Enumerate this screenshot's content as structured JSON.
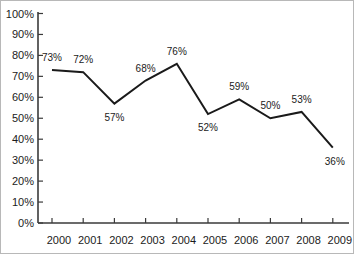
{
  "chart_data": {
    "type": "line",
    "title": "",
    "subtitle": "",
    "xlabel": "",
    "ylabel": "",
    "categories": [
      "2000",
      "2001",
      "2002",
      "2003",
      "2004",
      "2005",
      "2006",
      "2007",
      "2008",
      "2009"
    ],
    "values": [
      73,
      72,
      57,
      68,
      76,
      52,
      59,
      50,
      53,
      36
    ],
    "point_labels": [
      "73%",
      "72%",
      "57%",
      "68%",
      "76%",
      "52%",
      "59%",
      "50%",
      "53%",
      "36%"
    ],
    "ylim": [
      0,
      100
    ],
    "ytick_values": [
      0,
      10,
      20,
      30,
      40,
      50,
      60,
      70,
      80,
      90,
      100
    ],
    "ytick_labels": [
      "0%",
      "10%",
      "20%",
      "30%",
      "40%",
      "50%",
      "60%",
      "70%",
      "80%",
      "90%",
      "100%"
    ],
    "grid": false,
    "legend": "none",
    "series_color": "#1a1a1a",
    "axis_color": "#3a3a3a",
    "text_color": "#1b1b1b",
    "background": "#ffffff",
    "label_placement": [
      "above",
      "above",
      "below",
      "above",
      "above",
      "below",
      "above",
      "above",
      "above",
      "below-right"
    ],
    "markers": false
  }
}
